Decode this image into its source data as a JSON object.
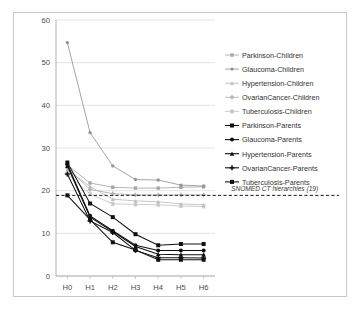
{
  "chart_data": {
    "type": "line",
    "title": "",
    "xlabel": "",
    "ylabel": "",
    "categories": [
      "H0",
      "H1",
      "H2",
      "H3",
      "H4",
      "H5",
      "H6"
    ],
    "ylim": [
      0,
      60
    ],
    "yticks": [
      0,
      10,
      20,
      30,
      40,
      50,
      60
    ],
    "grid": true,
    "legend_position": "right",
    "series": [
      {
        "name": "Parkinson-Children",
        "group": "children",
        "color": "#a6a6a6",
        "marker": "square",
        "values": [
          26.0,
          21.8,
          20.8,
          20.6,
          20.6,
          20.8,
          20.9
        ]
      },
      {
        "name": "Glaucoma-Children",
        "group": "children",
        "color": "#949494",
        "marker": "circle",
        "values": [
          54.7,
          33.6,
          25.8,
          22.6,
          22.5,
          21.3,
          21.1
        ]
      },
      {
        "name": "Hypertension-Children",
        "group": "children",
        "color": "#bdbdbd",
        "marker": "triangle",
        "values": [
          24.9,
          21.0,
          18.0,
          17.6,
          17.4,
          16.9,
          16.7
        ]
      },
      {
        "name": "OvarianCancer-Children",
        "group": "children",
        "color": "#b0b0b0",
        "marker": "cross",
        "values": [
          25.3,
          20.3,
          19.3,
          19.0,
          19.0,
          19.0,
          19.0
        ]
      },
      {
        "name": "Tuberculosis-Children",
        "group": "children",
        "color": "#c4c4c4",
        "marker": "star",
        "values": [
          23.9,
          19.2,
          16.9,
          16.8,
          16.7,
          16.4,
          16.3
        ]
      },
      {
        "name": "Parkinson-Parents",
        "group": "parents",
        "color": "#101010",
        "marker": "square",
        "values": [
          26.6,
          17.0,
          13.8,
          9.8,
          7.2,
          7.5,
          7.5
        ]
      },
      {
        "name": "Glaucoma-Parents",
        "group": "parents",
        "color": "#101010",
        "marker": "circle",
        "values": [
          26.2,
          14.1,
          10.6,
          7.2,
          6.0,
          6.0,
          6.0
        ]
      },
      {
        "name": "Hypertension-Parents",
        "group": "parents",
        "color": "#101010",
        "marker": "triangle",
        "values": [
          25.8,
          13.8,
          10.4,
          6.9,
          5.1,
          5.0,
          5.0
        ]
      },
      {
        "name": "OvarianCancer-Parents",
        "group": "parents",
        "color": "#101010",
        "marker": "cross",
        "values": [
          23.9,
          12.9,
          10.2,
          6.0,
          4.3,
          4.3,
          4.2
        ]
      },
      {
        "name": "Tuberculosis-Parents",
        "group": "parents",
        "color": "#101010",
        "marker": "square",
        "values": [
          18.9,
          13.2,
          7.9,
          6.1,
          3.8,
          3.8,
          3.8
        ]
      }
    ],
    "reference_line": {
      "label": "SNOMED CT hierarchies (19)",
      "value": 18.9,
      "style": "dashed",
      "color": "#1a1a1a"
    }
  }
}
